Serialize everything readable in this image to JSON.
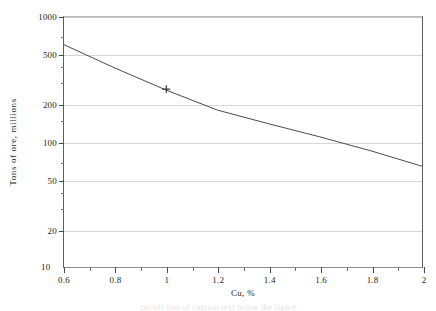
{
  "figure": {
    "background_color": "#ffffff",
    "line_color": "#4a4a4a",
    "grid_color": "#d6d6d6",
    "axis_color": "#5d5d5d"
  },
  "axes": {
    "x_title": "Cu, %",
    "y_title": "Tons of ore, millions",
    "x_major_labels": [
      "0.6",
      "0.8",
      "1",
      "1.2",
      "1.4",
      "1.6",
      "1.8",
      "2"
    ],
    "y_major_labels": [
      "1000",
      "500",
      "200",
      "100",
      "50",
      "20",
      "10"
    ]
  },
  "caption": {
    "clipped_line": "cut-off line of caption text below the figure"
  },
  "chart_data": {
    "type": "line",
    "title": "",
    "subtitle": "",
    "xlabel": "Cu, %",
    "ylabel": "Tons of ore, millions",
    "xscale": "linear",
    "yscale": "log",
    "xlim": [
      0.6,
      2.0
    ],
    "ylim": [
      10,
      1000
    ],
    "grid": "horizontal major gridlines only",
    "legend": "none",
    "x_major_ticks": [
      0.6,
      0.8,
      1.0,
      1.2,
      1.4,
      1.6,
      1.8,
      2.0
    ],
    "x_minor_ticks": [
      0.7,
      0.9,
      1.1,
      1.3,
      1.5,
      1.7,
      1.9
    ],
    "y_major_ticks": [
      10,
      20,
      50,
      100,
      200,
      500,
      1000
    ],
    "y_minor_ticks": [
      15,
      30,
      40,
      70,
      150,
      300,
      400,
      700
    ],
    "series": [
      {
        "name": "Tons of ore above cutoff grade",
        "style": "straight line on semi-log axes",
        "x": [
          0.6,
          0.8,
          1.0,
          1.2,
          1.4,
          1.6,
          1.8,
          2.0
        ],
        "y": [
          600,
          390,
          260,
          180,
          140,
          110,
          85,
          64
        ]
      }
    ],
    "markers": [
      {
        "label": "+",
        "x": 1.0,
        "y": 265,
        "note": "single cross marker plotted on the line near Cu = 1%"
      }
    ],
    "annotations": []
  }
}
